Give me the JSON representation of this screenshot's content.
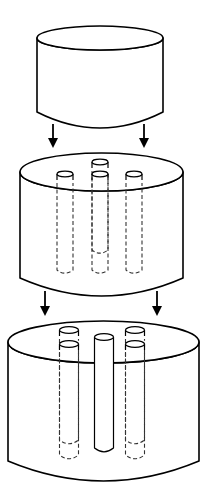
{
  "diagram": {
    "title": "",
    "colors": {
      "stroke": "#000000",
      "fill": "#ffffff",
      "background": "#ffffff"
    },
    "cylinders": [
      {
        "id": "top-cylinder",
        "x1": 37,
        "x2": 163,
        "topY": 38,
        "ry": 12,
        "bottomY": 112,
        "sag": 16,
        "rods": []
      },
      {
        "id": "middle-cylinder",
        "x1": 20,
        "x2": 183,
        "topY": 172,
        "ry": 19,
        "bottomY": 278,
        "sag": 18,
        "rods": [
          {
            "cx": 100,
            "capY": 162,
            "w": 16,
            "bottomY": 250,
            "style": "dashed",
            "layer": "back"
          },
          {
            "cx": 65,
            "capY": 174,
            "w": 16,
            "bottomY": 270,
            "style": "dashed",
            "layer": "front"
          },
          {
            "cx": 100,
            "capY": 174,
            "w": 16,
            "bottomY": 270,
            "style": "dashed",
            "layer": "front"
          },
          {
            "cx": 134,
            "capY": 174,
            "w": 16,
            "bottomY": 270,
            "style": "dashed",
            "layer": "front"
          }
        ]
      },
      {
        "id": "bottom-cylinder",
        "x1": 8,
        "x2": 199,
        "topY": 342,
        "ry": 21,
        "bottomY": 461,
        "sag": 20,
        "rods": [
          {
            "cx": 69,
            "capY": 330,
            "w": 19,
            "bottomY": 440,
            "style": "dashed",
            "layer": "back"
          },
          {
            "cx": 135,
            "capY": 330,
            "w": 19,
            "bottomY": 440,
            "style": "dashed",
            "layer": "back"
          },
          {
            "cx": 69,
            "capY": 344,
            "w": 19,
            "bottomY": 455,
            "style": "dashed",
            "layer": "front"
          },
          {
            "cx": 104,
            "capY": 337,
            "w": 19,
            "bottomY": 448,
            "style": "solid",
            "layer": "front"
          },
          {
            "cx": 135,
            "capY": 344,
            "w": 19,
            "bottomY": 455,
            "style": "dashed",
            "layer": "front"
          }
        ]
      }
    ],
    "arrows": [
      {
        "id": "arrow-top-left",
        "x": 53,
        "y1": 124,
        "y2": 148
      },
      {
        "id": "arrow-top-right",
        "x": 144,
        "y1": 124,
        "y2": 148
      },
      {
        "id": "arrow-middle-left",
        "x": 45,
        "y1": 291,
        "y2": 316
      },
      {
        "id": "arrow-middle-right",
        "x": 157,
        "y1": 291,
        "y2": 316
      }
    ]
  }
}
